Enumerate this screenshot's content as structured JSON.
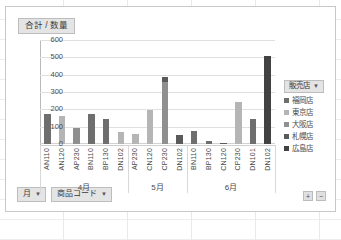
{
  "chart": {
    "value_field_label": "合計 / 数量",
    "legend_field_label": "販売店",
    "caret_glyph": "▼"
  },
  "field_buttons": [
    {
      "label": "月",
      "caret": "▼"
    },
    {
      "label": "商品コード",
      "caret": "▼"
    }
  ],
  "zoom_controls": [
    {
      "label": "+"
    },
    {
      "label": "−"
    }
  ],
  "colors": {
    "fukuoka": "#6e6e6e",
    "tokyo": "#b5b5b5",
    "osaka": "#8f8f8f",
    "sapporo": "#5a5a5a",
    "hiroshima": "#424242",
    "gridline": "#e0e0e0",
    "frame": "#c8c8c8",
    "button_face": "#e4e4e4"
  },
  "chart_data": {
    "type": "bar",
    "title": "合計 / 数量",
    "xlabel": "商品コード",
    "ylabel": "",
    "ylim": [
      0,
      600
    ],
    "yticks": [
      0,
      100,
      200,
      300,
      400,
      500,
      600
    ],
    "grid": true,
    "stacked": true,
    "legend_position": "right",
    "legend_title": "販売店",
    "groups": [
      {
        "label": "4月",
        "categories": [
          "AN110",
          "AN120",
          "AP230",
          "BN110",
          "BP130",
          "DN102"
        ]
      },
      {
        "label": "5月",
        "categories": [
          "AP230",
          "CN120",
          "CP230",
          "DN102"
        ]
      },
      {
        "label": "6月",
        "categories": [
          "BN110",
          "BP130",
          "CN120",
          "CP230",
          "DN101",
          "DN102"
        ]
      }
    ],
    "categories": [
      "AN110",
      "AN120",
      "AP230",
      "BN110",
      "BP130",
      "DN102",
      "AP230",
      "CN120",
      "CP230",
      "DN102",
      "BN110",
      "BP130",
      "CN120",
      "CP230",
      "DN101",
      "DN102"
    ],
    "series": [
      {
        "name": "福岡店",
        "color": "#6e6e6e",
        "values": [
          175,
          0,
          0,
          175,
          145,
          0,
          0,
          0,
          0,
          0,
          75,
          15,
          0,
          0,
          145,
          0
        ]
      },
      {
        "name": "東京店",
        "color": "#b5b5b5",
        "values": [
          0,
          160,
          0,
          0,
          0,
          70,
          55,
          195,
          0,
          0,
          0,
          0,
          0,
          240,
          0,
          0
        ]
      },
      {
        "name": "大阪店",
        "color": "#8f8f8f",
        "values": [
          0,
          0,
          95,
          0,
          0,
          0,
          0,
          0,
          355,
          0,
          0,
          0,
          0,
          0,
          0,
          0
        ]
      },
      {
        "name": "札幌店",
        "color": "#5a5a5a",
        "values": [
          0,
          0,
          0,
          0,
          0,
          0,
          0,
          0,
          30,
          50,
          0,
          0,
          8,
          0,
          0,
          0
        ]
      },
      {
        "name": "広島店",
        "color": "#424242",
        "values": [
          0,
          0,
          0,
          0,
          0,
          0,
          0,
          0,
          0,
          0,
          0,
          0,
          0,
          0,
          0,
          510
        ]
      }
    ],
    "totals": [
      175,
      160,
      95,
      175,
      145,
      70,
      55,
      195,
      385,
      50,
      75,
      15,
      8,
      240,
      145,
      510
    ]
  }
}
